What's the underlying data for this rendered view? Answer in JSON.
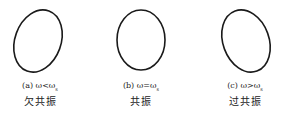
{
  "figure": {
    "panels": [
      {
        "id": "a",
        "label": "(a)",
        "relation": "ω<ω",
        "sub": "s",
        "name": "欠共振",
        "tilt": 20
      },
      {
        "id": "b",
        "label": "(b)",
        "relation": "ω=ω",
        "sub": "s",
        "name": "共振",
        "tilt": 0
      },
      {
        "id": "c",
        "label": "(c)",
        "relation": "ω>ω",
        "sub": "s",
        "name": "过共振",
        "tilt": -20
      }
    ],
    "stroke_color": "#1a1a1a"
  }
}
